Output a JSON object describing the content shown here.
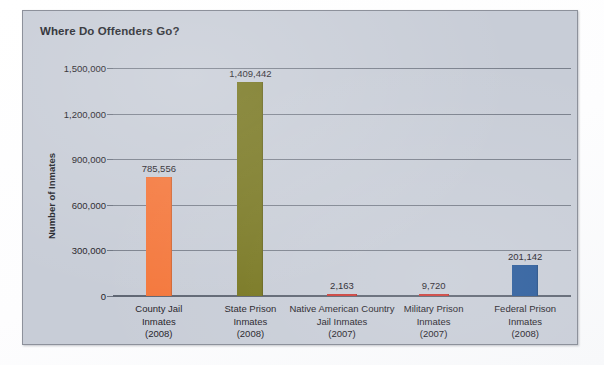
{
  "chart_data": {
    "type": "bar",
    "title": "Where Do Offenders Go?",
    "xlabel": "",
    "ylabel": "Number of Inmates",
    "ylim": [
      0,
      1500000
    ],
    "grid": true,
    "legend": "none",
    "ytick_labels": [
      "0",
      "300,000",
      "600,000",
      "900,000",
      "1,200,000",
      "1,500,000"
    ],
    "ytick_values": [
      0,
      300000,
      600000,
      900000,
      1200000,
      1500000
    ],
    "categories": [
      "County Jail Inmates (2008)",
      "State Prison Inmates (2008)",
      "Native American Country Jail Inmates (2007)",
      "Military Prison Inmates (2007)",
      "Federal Prison Inmates (2008)"
    ],
    "values": [
      785556,
      1409442,
      2163,
      9720,
      201142
    ],
    "value_labels": [
      "785,556",
      "1,409,442",
      "2,163",
      "9,720",
      "201,142"
    ],
    "bar_colors": [
      "#f4763a",
      "#77761f",
      "#cf3f3a",
      "#cf3f3a",
      "#2b5c9c"
    ],
    "category_lines": [
      [
        "County Jail",
        "Inmates",
        "(2008)"
      ],
      [
        "State Prison",
        "Inmates",
        "(2008)"
      ],
      [
        "Native American Country",
        "Jail Inmates",
        "(2007)"
      ],
      [
        "Military Prison",
        "Inmates",
        "(2007)"
      ],
      [
        "Federal Prison",
        "Inmates",
        "(2008)"
      ]
    ]
  },
  "panel": {
    "background_color": "#c8cdd7",
    "border_color": "#8d919b",
    "text_color": "#1f2127"
  }
}
